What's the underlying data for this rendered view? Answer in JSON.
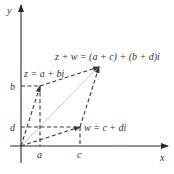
{
  "diagram": {
    "axes": {
      "x_label": "x",
      "y_label": "y"
    },
    "tick_labels": {
      "a": "a",
      "c": "c",
      "b": "b",
      "d": "d"
    },
    "points": {
      "z": {
        "label": "z = a + bi"
      },
      "w": {
        "label": "w = c + di"
      },
      "sum": {
        "label": "z + w = (a + c) + (b + d)i"
      }
    },
    "colors": {
      "axis": "#2a2a2a",
      "dashed": "#3a3a3a",
      "diagonal": "#c8c8c8"
    }
  }
}
